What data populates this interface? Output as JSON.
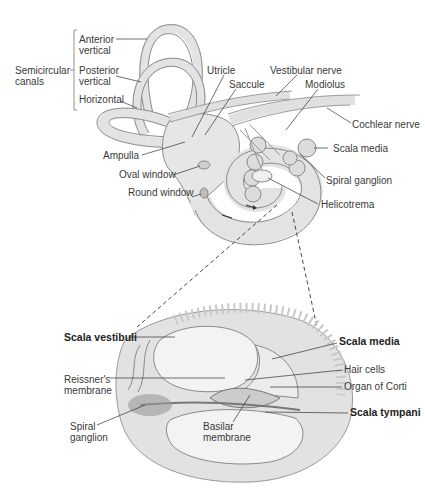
{
  "top_panel": {
    "group_label": "Semicircular\ncanals",
    "group_label_line1": "Semicircular",
    "group_label_line2": "canals",
    "labels": {
      "anterior_vertical_1": "Anterior",
      "anterior_vertical_2": "vertical",
      "posterior_vertical_1": "Posterior",
      "posterior_vertical_2": "vertical",
      "horizontal": "Horizontal",
      "ampulla": "Ampulla",
      "oval_window": "Oval window",
      "round_window": "Round window",
      "utricle": "Utricle",
      "saccule": "Saccule",
      "vestibular_nerve": "Vestibular nerve",
      "modiolus": "Modiolus",
      "cochlear_nerve": "Cochlear nerve",
      "scala_media": "Scala media",
      "spiral_ganglion": "Spiral ganglion",
      "helicotrema": "Helicotrema"
    }
  },
  "bottom_panel": {
    "labels": {
      "scala_vestibuli": "Scala vestibuli",
      "reissners_1": "Reissner's",
      "reissners_2": "membrane",
      "spiral_ganglion_1": "Spiral",
      "spiral_ganglion_2": "ganglion",
      "basilar_1": "Basilar",
      "basilar_2": "membrane",
      "scala_media": "Scala media",
      "hair_cells": "Hair cells",
      "organ_of_corti": "Organ of Corti",
      "scala_tympani": "Scala tympani"
    }
  },
  "colors": {
    "structure_fill": "#e6e6e6",
    "structure_stroke": "#8a8a8a",
    "bone": "#d6d6d6",
    "ganglion": "#9a9a9a",
    "leader": "#333333"
  }
}
